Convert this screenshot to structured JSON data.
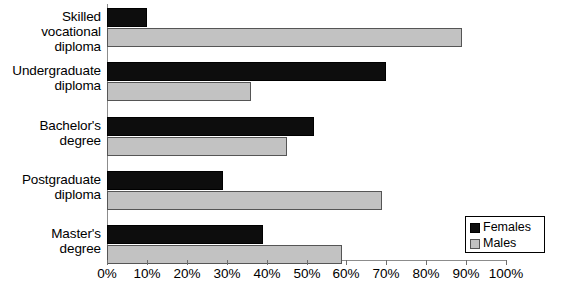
{
  "chart_data": {
    "type": "bar",
    "orientation": "horizontal",
    "title": "",
    "xlabel": "",
    "ylabel": "",
    "xlim": [
      0,
      100
    ],
    "xtick_labels": [
      "0%",
      "10%",
      "20%",
      "30%",
      "40%",
      "50%",
      "60%",
      "70%",
      "80%",
      "90%",
      "100%"
    ],
    "xticks": [
      0,
      10,
      20,
      30,
      40,
      50,
      60,
      70,
      80,
      90,
      100
    ],
    "grid": false,
    "legend_position": "bottom-right",
    "categories": [
      "Skilled vocational diploma",
      "Undergraduate diploma",
      "Bachelor's degree",
      "Postgraduate diploma",
      "Master's degree"
    ],
    "category_lines": [
      [
        "Skilled vocational",
        "diploma"
      ],
      [
        "Undergraduate",
        "diploma"
      ],
      [
        "Bachelor's",
        "degree"
      ],
      [
        "Postgraduate",
        "diploma"
      ],
      [
        "Master's",
        "degree"
      ]
    ],
    "series": [
      {
        "name": "Females",
        "color": "#0d0d0d",
        "values": [
          10,
          70,
          52,
          29,
          39
        ]
      },
      {
        "name": "Males",
        "color": "#c2c2c2",
        "values": [
          89,
          36,
          45,
          69,
          59
        ]
      }
    ]
  },
  "legend": {
    "items": [
      {
        "label": "Females",
        "swatch": "females"
      },
      {
        "label": "Males",
        "swatch": "males"
      }
    ]
  }
}
